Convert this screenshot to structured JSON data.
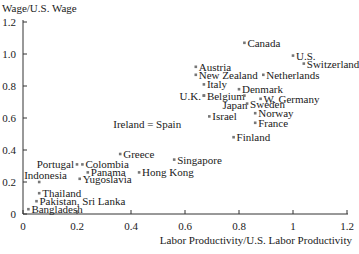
{
  "chart_data": {
    "type": "scatter",
    "title": "",
    "xlabel": "Labor Productivity/U.S. Labor Productivity",
    "ylabel": "Wage/U.S. Wage",
    "xlim": [
      0,
      1.2
    ],
    "ylim": [
      0,
      1.2
    ],
    "xticks": [
      "0",
      "0.2",
      "0.4",
      "0.6",
      "0.8",
      "1",
      "1.2"
    ],
    "yticks": [
      "0",
      "0.2",
      "0.4",
      "0.6",
      "0.8",
      "1.0",
      "1.2"
    ],
    "grid": false,
    "legend": null,
    "points": [
      {
        "label": "Canada",
        "x": 0.82,
        "y": 1.07,
        "anchor": "right"
      },
      {
        "label": "U.S.",
        "x": 1.0,
        "y": 0.99,
        "anchor": "right"
      },
      {
        "label": "Switzerland",
        "x": 1.04,
        "y": 0.94,
        "anchor": "right"
      },
      {
        "label": "Austria",
        "x": 0.64,
        "y": 0.92,
        "anchor": "right"
      },
      {
        "label": "New Zealand",
        "x": 0.64,
        "y": 0.87,
        "anchor": "right"
      },
      {
        "label": "Netherlands",
        "x": 0.89,
        "y": 0.87,
        "anchor": "right"
      },
      {
        "label": "Italy",
        "x": 0.67,
        "y": 0.81,
        "anchor": "right"
      },
      {
        "label": "Denmark",
        "x": 0.8,
        "y": 0.78,
        "anchor": "right"
      },
      {
        "label": "U.K.",
        "x": 0.67,
        "y": 0.74,
        "anchor": "left"
      },
      {
        "label": "Belgium",
        "x": 0.67,
        "y": 0.74,
        "anchor": "right"
      },
      {
        "label": "Japan",
        "x": 0.82,
        "y": 0.74,
        "anchor": "below-left"
      },
      {
        "label": "W. Germany",
        "x": 0.88,
        "y": 0.72,
        "anchor": "right"
      },
      {
        "label": "Sweden",
        "x": 0.83,
        "y": 0.69,
        "anchor": "right"
      },
      {
        "label": "Norway",
        "x": 0.86,
        "y": 0.63,
        "anchor": "right"
      },
      {
        "label": "France",
        "x": 0.86,
        "y": 0.57,
        "anchor": "right"
      },
      {
        "label": "Israel",
        "x": 0.69,
        "y": 0.61,
        "anchor": "right"
      },
      {
        "label": "Ireland = Spain",
        "x": 0.46,
        "y": 0.56,
        "anchor": "center"
      },
      {
        "label": "Finland",
        "x": 0.78,
        "y": 0.48,
        "anchor": "right"
      },
      {
        "label": "Greece",
        "x": 0.36,
        "y": 0.375,
        "anchor": "right"
      },
      {
        "label": "Singapore",
        "x": 0.56,
        "y": 0.34,
        "anchor": "right"
      },
      {
        "label": "Hong Kong",
        "x": 0.43,
        "y": 0.26,
        "anchor": "right"
      },
      {
        "label": "Portugal",
        "x": 0.2,
        "y": 0.31,
        "anchor": "left"
      },
      {
        "label": "Colombia",
        "x": 0.22,
        "y": 0.31,
        "anchor": "right"
      },
      {
        "label": "Panama",
        "x": 0.24,
        "y": 0.26,
        "anchor": "right"
      },
      {
        "label": "Yugoslavia",
        "x": 0.21,
        "y": 0.22,
        "anchor": "right"
      },
      {
        "label": "Indonesia",
        "x": 0.06,
        "y": 0.2,
        "anchor": "above-right"
      },
      {
        "label": "Thailand",
        "x": 0.06,
        "y": 0.13,
        "anchor": "right"
      },
      {
        "label": "Pakistan, Sri Lanka",
        "x": 0.05,
        "y": 0.08,
        "anchor": "right"
      },
      {
        "label": "Bangladesh",
        "x": 0.02,
        "y": 0.03,
        "anchor": "right"
      }
    ]
  },
  "colors": {
    "axis": "#333333",
    "text": "#1a1a1a",
    "marker": "#777777"
  }
}
